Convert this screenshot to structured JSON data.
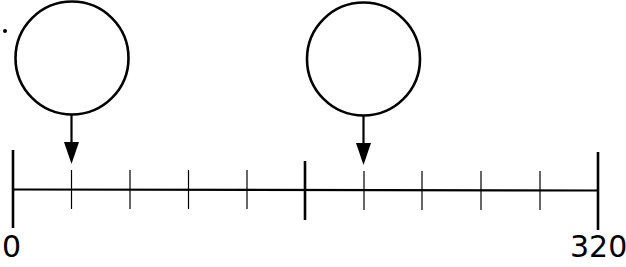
{
  "diagram": {
    "type": "number-line",
    "min_label": "0",
    "max_label": "320",
    "min_value": 0,
    "max_value": 320,
    "intervals": 10,
    "interval_value": 32,
    "line_color": "#000000",
    "background": "#ffffff",
    "markers": [
      {
        "id": "circle-1",
        "points_to_tick": 1,
        "value": 32,
        "content": ""
      },
      {
        "id": "circle-2",
        "points_to_tick": 6,
        "value": 192,
        "content": ""
      }
    ],
    "major_ticks": [
      0,
      5,
      10
    ],
    "minor_ticks": [
      1,
      2,
      3,
      4,
      6,
      7,
      8,
      9
    ]
  }
}
